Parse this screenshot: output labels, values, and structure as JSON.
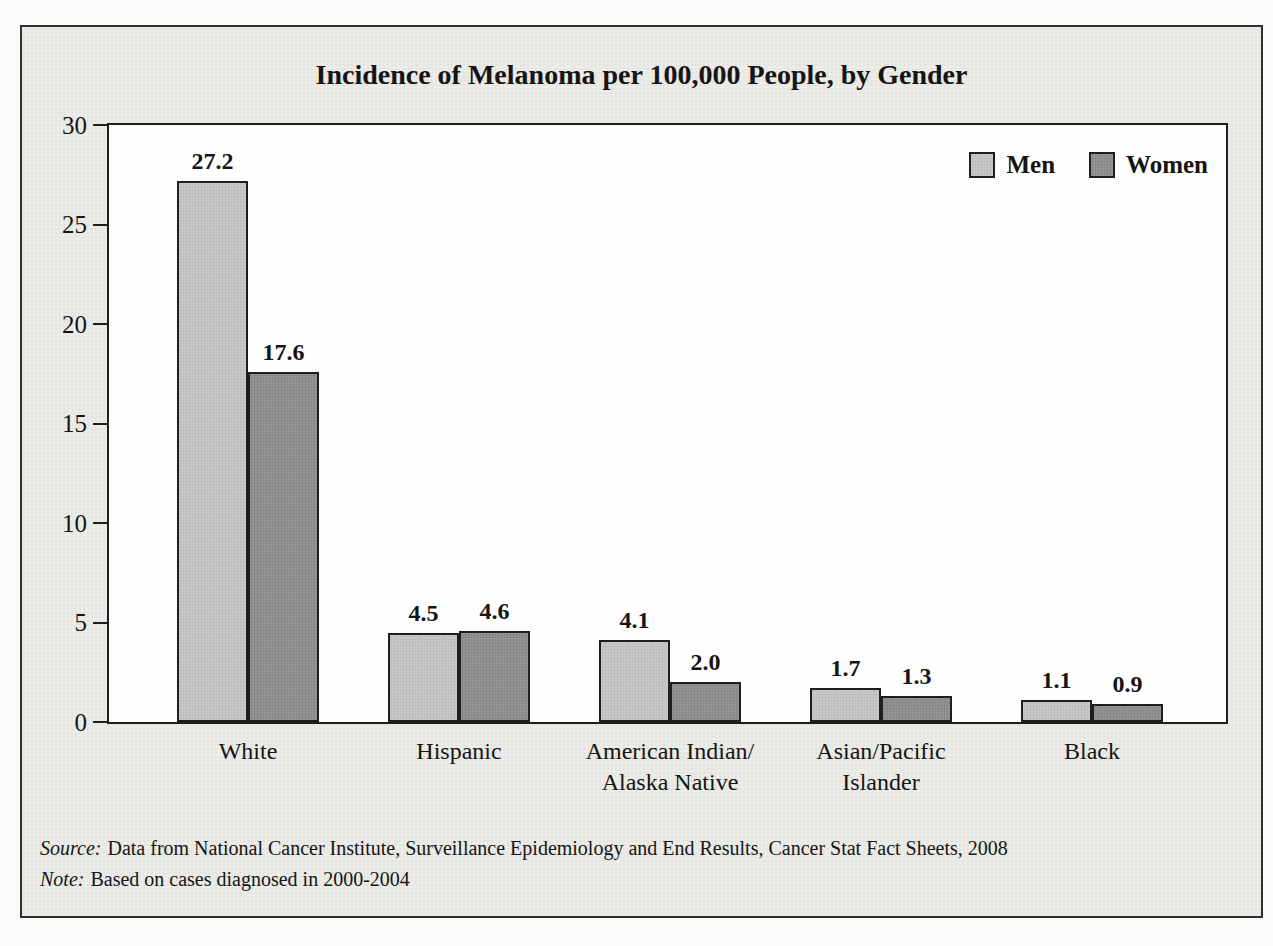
{
  "chart_data": {
    "type": "bar",
    "title": "Incidence of Melanoma per 100,000 People, by Gender",
    "categories": [
      "White",
      "Hispanic",
      "American Indian/Alaska Native",
      "Asian/Pacific Islander",
      "Black"
    ],
    "category_lines": [
      [
        "White"
      ],
      [
        "Hispanic"
      ],
      [
        "American Indian/",
        "Alaska Native"
      ],
      [
        "Asian/Pacific",
        "Islander"
      ],
      [
        "Black"
      ]
    ],
    "series": [
      {
        "name": "Men",
        "color": "#c4c4c4",
        "values": [
          27.2,
          4.5,
          4.1,
          1.7,
          1.1
        ],
        "labels": [
          "27.2",
          "4.5",
          "4.1",
          "1.7",
          "1.1"
        ]
      },
      {
        "name": "Women",
        "color": "#8e8e8e",
        "values": [
          17.6,
          4.6,
          2.0,
          1.3,
          0.9
        ],
        "labels": [
          "17.6",
          "4.6",
          "2.0",
          "1.3",
          "0.9"
        ]
      }
    ],
    "ylim": [
      0,
      30
    ],
    "yticks": [
      0,
      5,
      10,
      15,
      20,
      25,
      30
    ],
    "grid": false,
    "legend_position": "top-right-inside",
    "bar_value_labels": true,
    "xlabel": "",
    "ylabel": ""
  },
  "footer": {
    "source_label": "Source:",
    "source_text": "Data from National Cancer Institute, Surveillance Epidemiology and End Results, Cancer Stat Fact Sheets, 2008",
    "note_label": "Note:",
    "note_text": "Based on cases diagnosed in 2000-2004"
  },
  "colors": {
    "page_bg": "#fbfbfa",
    "frame_bg": "#ebebe7",
    "frame_border": "#2f2f2f",
    "plot_bg": "#fefefe",
    "plot_border": "#1e1e1e",
    "bar_border": "#1e1e1e",
    "men_bar": "#c4c4c4",
    "women_bar": "#8e8e8e",
    "text": "#151515"
  }
}
